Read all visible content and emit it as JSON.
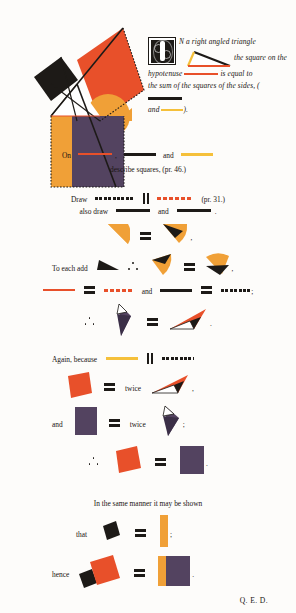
{
  "document": {
    "work": "Byrne's Euclid",
    "proposition_label": "Book I, Proposition 47"
  },
  "colors": {
    "red": "#e8502a",
    "yellow": "#f5c03a",
    "orange": "#f0a037",
    "purple": "#534360",
    "black": "#1d1a17",
    "paper": "#fdfcfa"
  },
  "header": {
    "initial": "I",
    "line1": "N   a   right   angled   triangle",
    "line2": "the square on the",
    "line3_a": "hypotenuse",
    "line3_b": "is equal to",
    "line4_a": "the sum of the squares of the sides, (",
    "line5_a": "and",
    "line5_b": ")."
  },
  "construction": {
    "on_label": "On",
    "comma": ",",
    "and_label": "and",
    "describe": "describe squares, (pr. 46.)"
  },
  "draw": {
    "draw_label": "Draw",
    "ref_31": "(pr. 31.)",
    "also_draw_label": "also draw",
    "and_label": "and",
    "period": "."
  },
  "step_equal1": {
    "comma": ","
  },
  "step_add": {
    "to_each_add": "To each add",
    "comma": ","
  },
  "step_lines": {
    "and_label": "and",
    "semicolon": ";"
  },
  "step_tri": {
    "period": "."
  },
  "again": {
    "again_because": "Again, because"
  },
  "twice": {
    "twice_label": "twice",
    "comma": ",",
    "and_label": "and",
    "semicolon": ";"
  },
  "conclude1": {
    "period": "."
  },
  "same_manner": {
    "text": "In the same manner it may be shown",
    "that_label": "that",
    "semicolon": ";"
  },
  "hence": {
    "hence_label": "hence",
    "period": "."
  },
  "qed": {
    "text": "Q. E. D."
  }
}
